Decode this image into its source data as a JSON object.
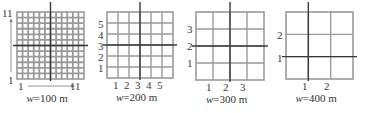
{
  "figure": {
    "panels": [
      {
        "id": "w100",
        "caption_var": "w",
        "caption_value": "=100 m",
        "cells": 12,
        "grid": {
          "x": 17,
          "y": 12,
          "size": 67
        },
        "thick_col": 6,
        "thick_row": 6,
        "cell_fill": "#ffffff",
        "line_color": "#9a9a9a",
        "thick_color": "#3a3a3a",
        "y_labels": [
          {
            "text": "11",
            "y": 8
          },
          {
            "text": "1",
            "y": 75
          }
        ],
        "x_labels": [
          {
            "text": "1",
            "x": 21
          },
          {
            "text": "11",
            "x": 76
          }
        ],
        "arrow_y": true,
        "arrow_x": true
      },
      {
        "id": "w200",
        "caption_var": "w",
        "caption_value": "=200 m",
        "cells": 6,
        "grid": {
          "x": 107,
          "y": 12,
          "size": 66
        },
        "thick_col": 3,
        "thick_row": 3,
        "cell_fill": "#ffffff",
        "line_color": "#9a9a9a",
        "thick_color": "#3a3a3a",
        "y_labels": [
          {
            "text": "5",
            "y": 19
          },
          {
            "text": "4",
            "y": 30
          },
          {
            "text": "3",
            "y": 41
          },
          {
            "text": "2",
            "y": 52
          },
          {
            "text": "1",
            "y": 63
          }
        ],
        "x_labels": [
          {
            "text": "1",
            "x": 116
          },
          {
            "text": "2",
            "x": 127
          },
          {
            "text": "3",
            "x": 138
          },
          {
            "text": "4",
            "x": 149
          },
          {
            "text": "5",
            "x": 160
          }
        ]
      },
      {
        "id": "w300",
        "caption_var": "w",
        "caption_value": "=300 m",
        "cells": 4,
        "grid": {
          "x": 196,
          "y": 12,
          "size": 68
        },
        "thick_col": 2,
        "thick_row": 2,
        "cell_fill": "#ffffff",
        "line_color": "#9a9a9a",
        "thick_color": "#3a3a3a",
        "y_labels": [
          {
            "text": "3",
            "y": 24
          },
          {
            "text": "2",
            "y": 41
          },
          {
            "text": "1",
            "y": 58
          }
        ],
        "x_labels": [
          {
            "text": "1",
            "x": 209
          },
          {
            "text": "2",
            "x": 226
          },
          {
            "text": "3",
            "x": 243
          }
        ]
      },
      {
        "id": "w400",
        "caption_var": "w",
        "caption_value": "=400 m",
        "cells": 3,
        "grid": {
          "x": 286,
          "y": 12,
          "size": 67
        },
        "thick_col": 1,
        "thick_row": 2,
        "cell_fill": "#ffffff",
        "line_color": "#9a9a9a",
        "thick_color": "#3a3a3a",
        "y_labels": [
          {
            "text": "2",
            "y": 30
          },
          {
            "text": "1",
            "y": 53
          }
        ],
        "x_labels": [
          {
            "text": "1",
            "x": 305
          },
          {
            "text": "2",
            "x": 327
          }
        ]
      }
    ]
  }
}
